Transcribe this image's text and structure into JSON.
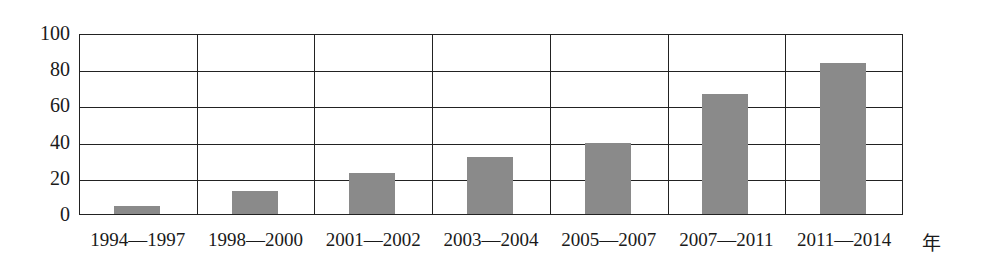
{
  "chart_data": {
    "type": "bar",
    "title": "",
    "xlabel": "年",
    "ylabel": "",
    "ylim": [
      0,
      100
    ],
    "yticks": [
      0,
      20,
      40,
      60,
      80,
      100
    ],
    "grid": true,
    "legend": null,
    "bar_color": "#8a8a8a",
    "categories": [
      "1994—1997",
      "1998—2000",
      "2001—2002",
      "2003—2004",
      "2005—2007",
      "2007—2011",
      "2011—2014"
    ],
    "values": [
      5,
      13,
      23,
      32,
      40,
      67,
      84
    ]
  },
  "labels": {
    "x_unit": "年",
    "yticks": [
      "0",
      "20",
      "40",
      "60",
      "80",
      "100"
    ],
    "xticks": [
      "1994—1997",
      "1998—2000",
      "2001—2002",
      "2003—2004",
      "2005—2007",
      "2007—2011",
      "2011—2014"
    ]
  }
}
